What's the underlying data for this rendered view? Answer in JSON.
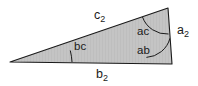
{
  "figure": {
    "type": "geometry-diagram",
    "shape": "triangle",
    "fill_color": "#bfbfbf",
    "stroke_color": "#1a1a1a",
    "background_color": "#ffffff",
    "label_color": "#1a1a1a"
  },
  "labels": {
    "side_top": {
      "base": "c",
      "sub": "2",
      "full": "c2"
    },
    "side_bottom": {
      "base": "b",
      "sub": "2",
      "full": "b2"
    },
    "side_right": {
      "base": "a",
      "sub": "2",
      "full": "a2"
    },
    "angle_left": "bc",
    "angle_upper_right": "ac",
    "angle_lower_right": "ab"
  },
  "geometry": {
    "vertices": {
      "left": [
        10,
        62
      ],
      "top_right": [
        168,
        8
      ],
      "bottom_right": [
        172,
        64
      ]
    },
    "interior_divider": {
      "from": [
        168,
        8
      ],
      "to": [
        10,
        62
      ],
      "note": "top edge c2 from left vertex to top-right vertex"
    },
    "angle_arcs": [
      {
        "name": "arc-bc",
        "at": "left",
        "radius": 62
      },
      {
        "name": "arc-ac",
        "at": "top_right",
        "radius": 26
      },
      {
        "name": "arc-ab",
        "at": "bottom_right",
        "radius": 26
      }
    ]
  }
}
